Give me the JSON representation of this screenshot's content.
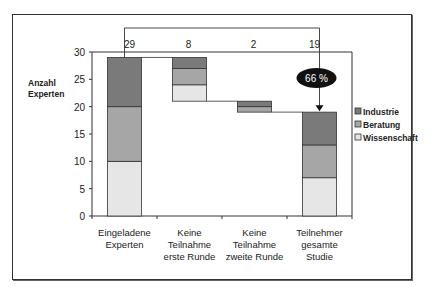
{
  "chart_data": {
    "type": "bar",
    "subtype": "stacked-waterfall",
    "title": "",
    "ylabel": "Anzahl Experten",
    "xlabel": "",
    "ylim": [
      0,
      30
    ],
    "yticks": [
      0,
      5,
      10,
      15,
      20,
      25,
      30
    ],
    "categories": [
      "Eingeladene Experten",
      "Keine Teilnahme erste Runde",
      "Keine Teilnahme zweite Runde",
      "Teilnehmer gesamte Studie"
    ],
    "category_lines": [
      [
        "Eingeladene",
        "Experten"
      ],
      [
        "Keine",
        "Teilnahme",
        "erste Runde"
      ],
      [
        "Keine",
        "Teilnahme",
        "zweite Runde"
      ],
      [
        "Teilnehmer",
        "gesamte",
        "Studie"
      ]
    ],
    "base": [
      0,
      21,
      19,
      0
    ],
    "series": [
      {
        "name": "Wissenschaft",
        "values": [
          10,
          3,
          0,
          7
        ],
        "color": "#e6e6e6"
      },
      {
        "name": "Beratung",
        "values": [
          10,
          3,
          1,
          6
        ],
        "color": "#a6a6a6"
      },
      {
        "name": "Industrie",
        "values": [
          9,
          2,
          1,
          6
        ],
        "color": "#7a7a7a"
      }
    ],
    "totals": [
      29,
      8,
      2,
      19
    ],
    "annotation": "66 %",
    "legend": [
      "Industrie",
      "Beratung",
      "Wissenschaft"
    ],
    "legend_position": "right",
    "grid": false
  }
}
